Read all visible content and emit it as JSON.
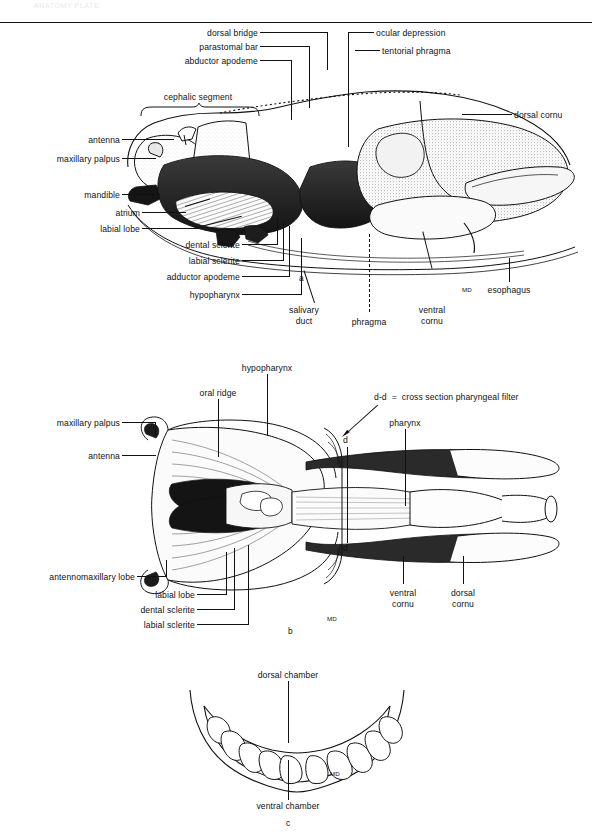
{
  "header": {
    "text": "ANATOMY PLATE"
  },
  "figure": {
    "panels": [
      {
        "id": "a",
        "letter": "a",
        "caption_letter": "a",
        "labels": [
          {
            "name": "dorsal-bridge",
            "text": "dorsal bridge"
          },
          {
            "name": "parastomal-bar",
            "text": "parastomal bar"
          },
          {
            "name": "abductor-apodeme",
            "text": "abductor apodeme"
          },
          {
            "name": "cephalic-segment",
            "text": "cephalic segment"
          },
          {
            "name": "antenna",
            "text": "antenna"
          },
          {
            "name": "maxillary-palpus",
            "text": "maxillary palpus"
          },
          {
            "name": "mandible",
            "text": "mandible"
          },
          {
            "name": "atrium",
            "text": "atrium"
          },
          {
            "name": "labial-lobe",
            "text": "labial lobe"
          },
          {
            "name": "dental-sclerite",
            "text": "dental sclerite"
          },
          {
            "name": "labial-sclerite",
            "text": "labial sclerite"
          },
          {
            "name": "adductor-apodeme",
            "text": "adductor apodeme"
          },
          {
            "name": "hypopharynx",
            "text": "hypopharynx"
          },
          {
            "name": "ocular-depression",
            "text": "ocular depression"
          },
          {
            "name": "tentorial-phragma",
            "text": "tentorial phragma"
          },
          {
            "name": "dorsal-cornu",
            "text": "dorsal cornu"
          },
          {
            "name": "salivary-duct",
            "text": "salivary\nduct"
          },
          {
            "name": "phragma",
            "text": "phragma"
          },
          {
            "name": "ventral-cornu",
            "text": "ventral\ncornu"
          },
          {
            "name": "esophagus",
            "text": "esophagus"
          },
          {
            "name": "md-marker",
            "text": "MD"
          }
        ]
      },
      {
        "id": "b",
        "letter": "b",
        "caption_letter": "b",
        "labels": [
          {
            "name": "hypopharynx",
            "text": "hypopharynx"
          },
          {
            "name": "oral-ridge",
            "text": "oral ridge"
          },
          {
            "name": "maxillary-palpus",
            "text": "maxillary palpus"
          },
          {
            "name": "antenna",
            "text": "antenna"
          },
          {
            "name": "section-key",
            "text": "d-d  =  cross section pharyngeal filter"
          },
          {
            "name": "pharynx",
            "text": "pharynx"
          },
          {
            "name": "section-marker-top",
            "text": "d"
          },
          {
            "name": "section-marker-bottom",
            "text": "d"
          },
          {
            "name": "antennomaxillary-lobe",
            "text": "antennomaxillary lobe"
          },
          {
            "name": "labial-lobe",
            "text": "labial lobe"
          },
          {
            "name": "dental-sclerite",
            "text": "dental sclerite"
          },
          {
            "name": "labial-sclerite",
            "text": "labial sclerite"
          },
          {
            "name": "ventral-cornu",
            "text": "ventral\ncornu"
          },
          {
            "name": "dorsal-cornu",
            "text": "dorsal\ncornu"
          },
          {
            "name": "md-marker",
            "text": "MD"
          }
        ]
      },
      {
        "id": "c",
        "letter": "c",
        "caption_letter": "c",
        "labels": [
          {
            "name": "dorsal-chamber",
            "text": "dorsal chamber"
          },
          {
            "name": "ventral-chamber",
            "text": "ventral chamber"
          },
          {
            "name": "md-marker",
            "text": "MD"
          }
        ]
      }
    ]
  },
  "colors": {
    "ink": "#111111",
    "paper": "#ffffff",
    "header": "#e9e9e9"
  }
}
